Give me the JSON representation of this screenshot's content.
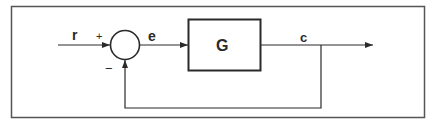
{
  "diagram": {
    "type": "feedback-control-block-diagram",
    "signals": {
      "input": "r",
      "error": "e",
      "output": "c"
    },
    "block": {
      "label": "G"
    },
    "summing_junction": {
      "plus_sign": "+",
      "minus_sign": "−"
    },
    "colors": {
      "line": "#2a2a2a",
      "frame": "#555555",
      "background": "#ffffff"
    }
  }
}
